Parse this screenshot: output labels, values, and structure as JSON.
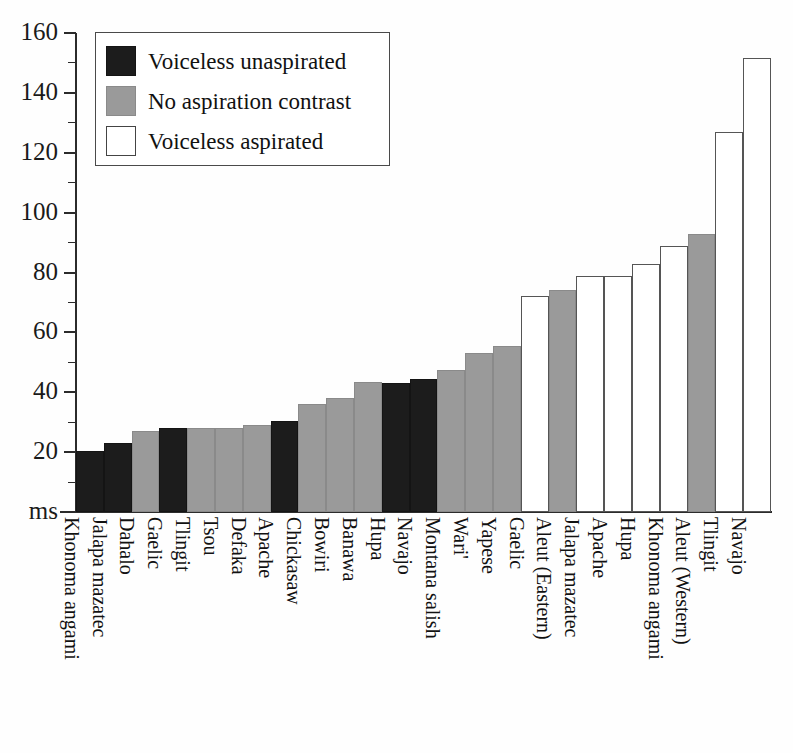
{
  "chart_data": {
    "type": "bar",
    "title": "",
    "xlabel": "",
    "ylabel": "ms",
    "ylim": [
      0,
      160
    ],
    "yticks": [
      0,
      20,
      40,
      60,
      80,
      100,
      120,
      140,
      160
    ],
    "ytick_labels": [
      "ms",
      "20",
      "40",
      "60",
      "80",
      "100",
      "120",
      "140",
      "160"
    ],
    "minor_ticks": [
      10,
      30,
      50,
      70,
      90,
      110,
      130,
      150
    ],
    "grid": false,
    "legend_position": "top-left",
    "categories": [
      "Khonoma angami",
      "Jalapa mazatec",
      "Dahalo",
      "Gaelic",
      "Tlingit",
      "Tsou",
      "Defaka",
      "Apache",
      "Chickasaw",
      "Bowiri",
      "Banawa",
      "Hupa",
      "Navajo",
      "Montana salish",
      "Wari'",
      "Yapese",
      "Gaelic",
      "Aleut (Eastern)",
      "Jalapa mazatec",
      "Apache",
      "Hupa",
      "Khonoma angami",
      "Aleut (Western)",
      "Tlingit",
      "Navajo"
    ],
    "values": [
      20.5,
      23,
      27,
      28,
      28,
      28,
      29,
      30.5,
      36,
      38,
      43.5,
      43,
      44.5,
      47.5,
      53,
      55.5,
      72,
      74,
      79,
      79,
      83,
      89,
      93,
      127,
      151.5
    ],
    "groups": [
      "voiceless-unaspirated",
      "voiceless-unaspirated",
      "no-aspiration-contrast",
      "voiceless-unaspirated",
      "no-aspiration-contrast",
      "no-aspiration-contrast",
      "no-aspiration-contrast",
      "voiceless-unaspirated",
      "no-aspiration-contrast",
      "no-aspiration-contrast",
      "no-aspiration-contrast",
      "voiceless-unaspirated",
      "voiceless-unaspirated",
      "no-aspiration-contrast",
      "no-aspiration-contrast",
      "no-aspiration-contrast",
      "voiceless-aspirated",
      "no-aspiration-contrast",
      "voiceless-aspirated",
      "voiceless-aspirated",
      "voiceless-aspirated",
      "voiceless-aspirated",
      "no-aspiration-contrast",
      "voiceless-aspirated",
      "voiceless-aspirated"
    ],
    "legend": [
      {
        "label": "Voiceless unaspirated",
        "key": "voiceless-unaspirated",
        "color": "#1c1c1c"
      },
      {
        "label": "No aspiration contrast",
        "key": "no-aspiration-contrast",
        "color": "#9a9a9a"
      },
      {
        "label": "Voiceless aspirated",
        "key": "voiceless-aspirated",
        "color": "#ffffff"
      }
    ]
  }
}
